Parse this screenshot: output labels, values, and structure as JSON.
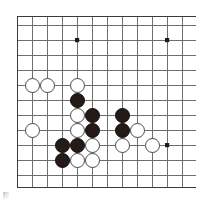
{
  "diagram": {
    "kind": "go-board-diagram",
    "board_size": 19,
    "visible_region": "bottom-left quadrant",
    "colors": {
      "background": "#ffffff",
      "grid_line": "#6e6e6e",
      "border_line": "#3c3c3c",
      "black_stone": "#241a17",
      "white_stone": "#ffffff",
      "white_stone_edge": "#4a4a4a",
      "star_point": "#1a1a1a"
    },
    "geometry": {
      "origin_x": 17,
      "origin_y": 25,
      "spacing": 15,
      "stone_radius": 7.5,
      "columns": 13,
      "rows": 11,
      "border_left_x": 17,
      "border_top_y": 16,
      "border_bottom_y": 187,
      "clip_right_x": 196
    },
    "star_points": [
      {
        "name": "hoshi-upper-left",
        "col": 4,
        "row": 1
      },
      {
        "name": "hoshi-upper-right",
        "col": 10,
        "row": 1
      },
      {
        "name": "hoshi-center-right",
        "col": 10,
        "row": 8
      }
    ],
    "stones": [
      {
        "id": "w1",
        "color": "white",
        "col": 1,
        "row": 4
      },
      {
        "id": "w2",
        "color": "white",
        "col": 2,
        "row": 4
      },
      {
        "id": "w3",
        "color": "white",
        "col": 4,
        "row": 4
      },
      {
        "id": "b1",
        "color": "black",
        "col": 4,
        "row": 5
      },
      {
        "id": "w4",
        "color": "white",
        "col": 4,
        "row": 6
      },
      {
        "id": "b2",
        "color": "black",
        "col": 5,
        "row": 6
      },
      {
        "id": "b3",
        "color": "black",
        "col": 7,
        "row": 6
      },
      {
        "id": "w5",
        "color": "white",
        "col": 1,
        "row": 7
      },
      {
        "id": "w6",
        "color": "white",
        "col": 4,
        "row": 7
      },
      {
        "id": "b4",
        "color": "black",
        "col": 5,
        "row": 7
      },
      {
        "id": "b5",
        "color": "black",
        "col": 7,
        "row": 7
      },
      {
        "id": "w7",
        "color": "white",
        "col": 8,
        "row": 7
      },
      {
        "id": "b6",
        "color": "black",
        "col": 3,
        "row": 8
      },
      {
        "id": "b7",
        "color": "black",
        "col": 4,
        "row": 8
      },
      {
        "id": "w8",
        "color": "white",
        "col": 5,
        "row": 8
      },
      {
        "id": "w9",
        "color": "white",
        "col": 7,
        "row": 8
      },
      {
        "id": "w10",
        "color": "white",
        "col": 9,
        "row": 8
      },
      {
        "id": "b8",
        "color": "black",
        "col": 3,
        "row": 9
      },
      {
        "id": "w11",
        "color": "white",
        "col": 4,
        "row": 9
      },
      {
        "id": "w12",
        "color": "white",
        "col": 5,
        "row": 9
      }
    ],
    "stone_counts": {
      "black": 8,
      "white": 12,
      "total": 20
    }
  }
}
